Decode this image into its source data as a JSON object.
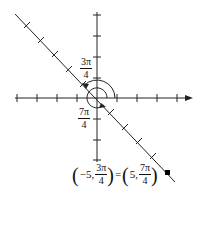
{
  "diagram": {
    "type": "polar-coordinate-plot",
    "axes": {
      "color": "#222222",
      "x_arrow": true,
      "y_arrow": false
    },
    "line": {
      "description": "line through origin at angle 3π/4 / 7π/4",
      "color": "#222222"
    },
    "labels": {
      "angle_upper": {
        "num": "3π",
        "den": "4"
      },
      "angle_lower": {
        "num": "7π",
        "den": "4"
      }
    },
    "equation": {
      "left_open": "(",
      "left_r": "−5,",
      "left_theta": {
        "num": "3π",
        "den": "4"
      },
      "left_close": ")",
      "equals": "=",
      "right_open": "(",
      "right_r": "5,",
      "right_theta": {
        "num": "7π",
        "den": "4"
      },
      "right_close": ")"
    },
    "point": {
      "label": "point (5, 7π/4)",
      "color": "#000000"
    }
  }
}
